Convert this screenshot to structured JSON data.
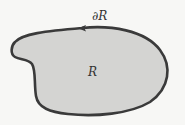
{
  "diagram": {
    "region_label": "R",
    "boundary_label": "∂R",
    "boundary_orientation": "counterclockwise",
    "colors": {
      "background": "#f7f7f5",
      "region_fill": "#d4d4d2",
      "boundary_stroke": "#3a3a3a",
      "text": "#333333"
    }
  }
}
